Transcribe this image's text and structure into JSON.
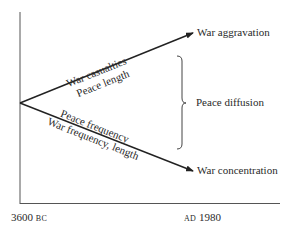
{
  "diagram": {
    "type": "trend-divergence",
    "axis": {
      "x_start_label": {
        "number": "3600",
        "era": "BC"
      },
      "x_end_label": {
        "era": "AD",
        "number": "1980"
      }
    },
    "upper_arrow": {
      "end_label": "War aggravation",
      "above_label": "War casualties",
      "below_label": "Peace length"
    },
    "lower_arrow": {
      "end_label": "War concentration",
      "above_label": "Peace frequency",
      "below_label": "War frequency, length"
    },
    "bracket_label": "Peace diffusion"
  }
}
